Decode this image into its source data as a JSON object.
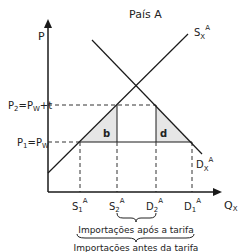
{
  "title": "País A",
  "axes": {
    "y_label": "P",
    "x_label_main": "Q",
    "x_label_sub": "X"
  },
  "prices": {
    "p2": {
      "main": "P",
      "sub": "2",
      "rest": "=P",
      "sub2": "W",
      "tail": "+t"
    },
    "p1": {
      "main": "P",
      "sub": "1",
      "rest": "=P",
      "sub2": "W",
      "tail": ""
    }
  },
  "curves": {
    "supply": {
      "main": "S",
      "sub": "X",
      "sup": "A"
    },
    "demand": {
      "main": "D",
      "sub": "X",
      "sup": "A"
    }
  },
  "quantities": [
    {
      "id": "s1",
      "main": "S",
      "sub": "1",
      "sup": "A"
    },
    {
      "id": "s2",
      "main": "S",
      "sub": "2",
      "sup": "A"
    },
    {
      "id": "d2",
      "main": "D",
      "sub": "2",
      "sup": "A"
    },
    {
      "id": "d1",
      "main": "D",
      "sub": "1",
      "sup": "A"
    }
  ],
  "areas": {
    "b": "b",
    "d": "d"
  },
  "braces": {
    "after": "Importações após a tarifa",
    "before": "Importações antes da tarifa"
  },
  "colors": {
    "line": "#1a1a1a",
    "shade": "#e6e6e6",
    "text": "#222222"
  }
}
